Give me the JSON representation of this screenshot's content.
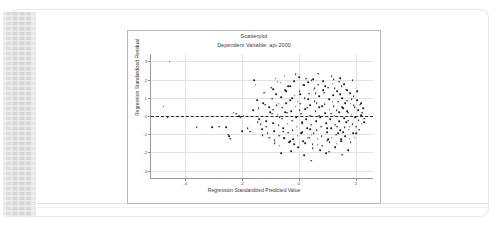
{
  "document": {
    "binding_label": "scanned-page-binding"
  },
  "chart_data": {
    "type": "scatter",
    "title": "Scatterplot",
    "subtitle": "Dependent Variable: api 2000",
    "xlabel": "Regression Standardized Predicted Value",
    "ylabel": "Regression Standardized Residual",
    "xlim": [
      -5.2,
      2.6
    ],
    "ylim": [
      -3.4,
      3.4
    ],
    "xticks": [
      -4,
      -2,
      0,
      2
    ],
    "yticks": [
      3,
      2,
      1,
      0,
      -1,
      -2,
      -3
    ],
    "grid": true,
    "legend": "none",
    "reference_line": {
      "type": "horizontal",
      "y": 0,
      "style": "dashed",
      "color": "#2b2b2b"
    },
    "marker": {
      "shape": "circle",
      "color": "#1a1a1a",
      "size": 1.7
    },
    "points": [
      [
        -4.55,
        2.98
      ],
      [
        -4.75,
        0.52
      ],
      [
        -4.62,
        -0.08
      ],
      [
        -3.6,
        -0.62
      ],
      [
        -3.05,
        -0.6
      ],
      [
        -2.8,
        -0.58
      ],
      [
        -2.55,
        -0.62
      ],
      [
        -2.48,
        -1.02
      ],
      [
        -2.45,
        -1.12
      ],
      [
        -2.42,
        -1.24
      ],
      [
        -2.3,
        0.18
      ],
      [
        -2.22,
        0.12
      ],
      [
        -2.1,
        -0.02
      ],
      [
        -2.05,
        -0.05
      ],
      [
        -1.95,
        0.02
      ],
      [
        -2.0,
        -0.82
      ],
      [
        -1.8,
        -0.68
      ],
      [
        -1.72,
        -0.85
      ],
      [
        -1.58,
        1.98
      ],
      [
        -1.52,
        1.72
      ],
      [
        -1.48,
        0.88
      ],
      [
        -1.42,
        0.42
      ],
      [
        -1.4,
        -0.18
      ],
      [
        -1.35,
        -0.45
      ],
      [
        -1.3,
        -0.72
      ],
      [
        -1.28,
        -1.05
      ],
      [
        -1.22,
        1.28
      ],
      [
        -1.18,
        0.62
      ],
      [
        -1.15,
        -0.28
      ],
      [
        -1.1,
        -0.95
      ],
      [
        -1.05,
        -1.18
      ],
      [
        -1.02,
        0.22
      ],
      [
        -0.98,
        1.55
      ],
      [
        -0.95,
        0.95
      ],
      [
        -0.92,
        0.35
      ],
      [
        -0.9,
        -0.38
      ],
      [
        -0.88,
        -0.82
      ],
      [
        -0.85,
        -1.32
      ],
      [
        -0.82,
        2.05
      ],
      [
        -0.8,
        1.18
      ],
      [
        -0.78,
        0.58
      ],
      [
        -0.75,
        0.08
      ],
      [
        -0.72,
        -0.52
      ],
      [
        -0.7,
        -1.08
      ],
      [
        -0.68,
        -1.62
      ],
      [
        -0.65,
        1.82
      ],
      [
        -0.62,
        1.05
      ],
      [
        -0.6,
        0.45
      ],
      [
        -0.58,
        -0.15
      ],
      [
        -0.55,
        -0.68
      ],
      [
        -0.52,
        -1.22
      ],
      [
        -0.5,
        2.22
      ],
      [
        -0.48,
        1.42
      ],
      [
        -0.45,
        0.72
      ],
      [
        -0.42,
        0.18
      ],
      [
        -0.4,
        -0.42
      ],
      [
        -0.38,
        -0.92
      ],
      [
        -0.35,
        -1.45
      ],
      [
        -0.32,
        1.62
      ],
      [
        -0.3,
        0.88
      ],
      [
        -0.28,
        0.28
      ],
      [
        -0.25,
        -0.25
      ],
      [
        -0.22,
        -0.78
      ],
      [
        -0.2,
        -1.28
      ],
      [
        -0.18,
        1.92
      ],
      [
        -0.15,
        1.12
      ],
      [
        -0.12,
        0.52
      ],
      [
        -0.1,
        -0.05
      ],
      [
        -0.08,
        -0.58
      ],
      [
        -0.05,
        -1.08
      ],
      [
        -0.02,
        -1.72
      ],
      [
        0.0,
        2.12
      ],
      [
        0.02,
        1.35
      ],
      [
        0.05,
        0.68
      ],
      [
        0.08,
        0.12
      ],
      [
        0.1,
        -0.35
      ],
      [
        0.12,
        -0.88
      ],
      [
        0.15,
        -1.38
      ],
      [
        0.18,
        1.68
      ],
      [
        0.2,
        0.98
      ],
      [
        0.22,
        0.38
      ],
      [
        0.25,
        -0.18
      ],
      [
        0.28,
        -0.68
      ],
      [
        0.3,
        -1.18
      ],
      [
        0.32,
        1.85
      ],
      [
        0.35,
        1.22
      ],
      [
        0.38,
        0.58
      ],
      [
        0.4,
        0.02
      ],
      [
        0.42,
        -0.48
      ],
      [
        0.45,
        -1.02
      ],
      [
        0.48,
        -1.55
      ],
      [
        0.5,
        2.02
      ],
      [
        0.52,
        1.45
      ],
      [
        0.55,
        0.82
      ],
      [
        0.58,
        0.25
      ],
      [
        0.6,
        -0.28
      ],
      [
        0.62,
        -0.78
      ],
      [
        0.65,
        -1.25
      ],
      [
        0.68,
        1.72
      ],
      [
        0.7,
        1.08
      ],
      [
        0.72,
        0.48
      ],
      [
        0.75,
        -0.08
      ],
      [
        0.78,
        -0.58
      ],
      [
        0.8,
        -1.12
      ],
      [
        0.82,
        -1.62
      ],
      [
        0.85,
        1.92
      ],
      [
        0.88,
        1.28
      ],
      [
        0.9,
        0.65
      ],
      [
        0.92,
        0.15
      ],
      [
        0.95,
        -0.38
      ],
      [
        0.98,
        -0.88
      ],
      [
        1.0,
        -1.35
      ],
      [
        1.02,
        1.55
      ],
      [
        1.05,
        0.92
      ],
      [
        1.08,
        0.35
      ],
      [
        1.1,
        -0.18
      ],
      [
        1.12,
        -0.68
      ],
      [
        1.15,
        -1.18
      ],
      [
        1.18,
        1.78
      ],
      [
        1.2,
        1.15
      ],
      [
        1.22,
        0.55
      ],
      [
        1.25,
        0.02
      ],
      [
        1.28,
        -0.48
      ],
      [
        1.3,
        -1.02
      ],
      [
        1.32,
        -1.52
      ],
      [
        1.35,
        1.38
      ],
      [
        1.38,
        0.78
      ],
      [
        1.4,
        0.22
      ],
      [
        1.42,
        -0.28
      ],
      [
        1.45,
        -0.78
      ],
      [
        1.48,
        -1.28
      ],
      [
        1.5,
        1.62
      ],
      [
        1.52,
        0.98
      ],
      [
        1.55,
        0.42
      ],
      [
        1.58,
        -0.12
      ],
      [
        1.6,
        -0.62
      ],
      [
        1.62,
        -1.12
      ],
      [
        1.65,
        1.45
      ],
      [
        1.68,
        0.85
      ],
      [
        1.7,
        0.28
      ],
      [
        1.72,
        -0.25
      ],
      [
        1.75,
        -0.75
      ],
      [
        1.78,
        -1.25
      ],
      [
        1.8,
        1.25
      ],
      [
        1.82,
        0.68
      ],
      [
        1.85,
        0.08
      ],
      [
        1.88,
        -0.45
      ],
      [
        1.9,
        -0.95
      ],
      [
        1.92,
        1.08
      ],
      [
        1.95,
        0.48
      ],
      [
        1.98,
        -0.08
      ],
      [
        2.0,
        -0.58
      ],
      [
        2.05,
        0.88
      ],
      [
        2.08,
        0.32
      ],
      [
        2.1,
        -0.22
      ],
      [
        2.15,
        0.62
      ],
      [
        2.18,
        0.05
      ],
      [
        2.2,
        -0.42
      ],
      [
        2.25,
        0.42
      ],
      [
        2.3,
        -0.15
      ],
      [
        -0.62,
        -2.05
      ],
      [
        0.18,
        -2.15
      ],
      [
        0.95,
        -2.05
      ],
      [
        1.52,
        -2.12
      ],
      [
        0.42,
        -2.45
      ],
      [
        1.05,
        -1.95
      ],
      [
        -0.28,
        -1.92
      ],
      [
        1.72,
        -1.88
      ],
      [
        0.68,
        2.32
      ],
      [
        1.15,
        2.18
      ],
      [
        -0.12,
        2.28
      ],
      [
        1.88,
        1.98
      ],
      [
        0.55,
        1.52
      ],
      [
        1.25,
        1.52
      ],
      [
        -0.45,
        1.38
      ],
      [
        0.05,
        1.18
      ],
      [
        0.85,
        1.42
      ],
      [
        1.45,
        1.18
      ],
      [
        -0.72,
        0.68
      ],
      [
        2.05,
        1.35
      ],
      [
        0.32,
        0.92
      ],
      [
        1.62,
        0.72
      ],
      [
        -0.95,
        0.12
      ],
      [
        1.35,
        -0.58
      ],
      [
        0.22,
        -1.48
      ],
      [
        1.08,
        -1.45
      ],
      [
        -0.18,
        -1.55
      ],
      [
        1.82,
        -1.42
      ],
      [
        0.48,
        -1.75
      ],
      [
        1.28,
        -1.72
      ],
      [
        -0.52,
        -1.18
      ],
      [
        1.95,
        -1.18
      ],
      [
        0.75,
        -1.88
      ],
      [
        1.55,
        -0.88
      ],
      [
        -0.85,
        -1.48
      ],
      [
        2.12,
        -0.75
      ],
      [
        0.15,
        1.72
      ],
      [
        1.42,
        1.88
      ],
      [
        -0.38,
        1.62
      ],
      [
        0.92,
        1.65
      ],
      [
        1.68,
        1.42
      ],
      [
        -0.05,
        0.78
      ],
      [
        0.62,
        0.72
      ],
      [
        1.18,
        0.78
      ],
      [
        -0.68,
        -0.05
      ],
      [
        2.22,
        0.18
      ],
      [
        0.38,
        -0.72
      ],
      [
        1.48,
        -1.38
      ],
      [
        -1.05,
        0.48
      ],
      [
        0.08,
        -0.95
      ],
      [
        1.72,
        0.18
      ],
      [
        0.52,
        -0.95
      ],
      [
        -1.25,
        0.72
      ],
      [
        1.92,
        0.58
      ],
      [
        0.28,
        0.45
      ],
      [
        1.12,
        0.12
      ],
      [
        -1.45,
        -0.35
      ],
      [
        2.28,
        -0.35
      ],
      [
        0.72,
        0.02
      ],
      [
        1.32,
        0.32
      ],
      [
        -1.62,
        0.32
      ],
      [
        0.98,
        -0.68
      ],
      [
        0.02,
        0.32
      ],
      [
        1.78,
        -0.58
      ],
      [
        -0.75,
        1.88
      ],
      [
        0.45,
        1.95
      ],
      [
        1.22,
        2.02
      ],
      [
        -0.25,
        0.98
      ],
      [
        1.58,
        1.75
      ],
      [
        0.65,
        -1.58
      ],
      [
        1.02,
        -1.28
      ],
      [
        -0.55,
        -0.85
      ],
      [
        2.02,
        -0.95
      ],
      [
        0.35,
        -1.18
      ],
      [
        1.38,
        -0.95
      ],
      [
        -0.32,
        -1.38
      ],
      [
        1.85,
        0.92
      ],
      [
        0.82,
        0.55
      ],
      [
        1.52,
        0.48
      ],
      [
        -1.15,
        -0.58
      ],
      [
        0.12,
        -0.42
      ],
      [
        1.65,
        -0.32
      ],
      [
        -0.48,
        0.22
      ],
      [
        2.18,
        0.72
      ],
      [
        0.58,
        1.25
      ],
      [
        1.45,
        2.08
      ],
      [
        -0.92,
        1.48
      ],
      [
        0.25,
        2.05
      ]
    ],
    "point_count": 228
  }
}
